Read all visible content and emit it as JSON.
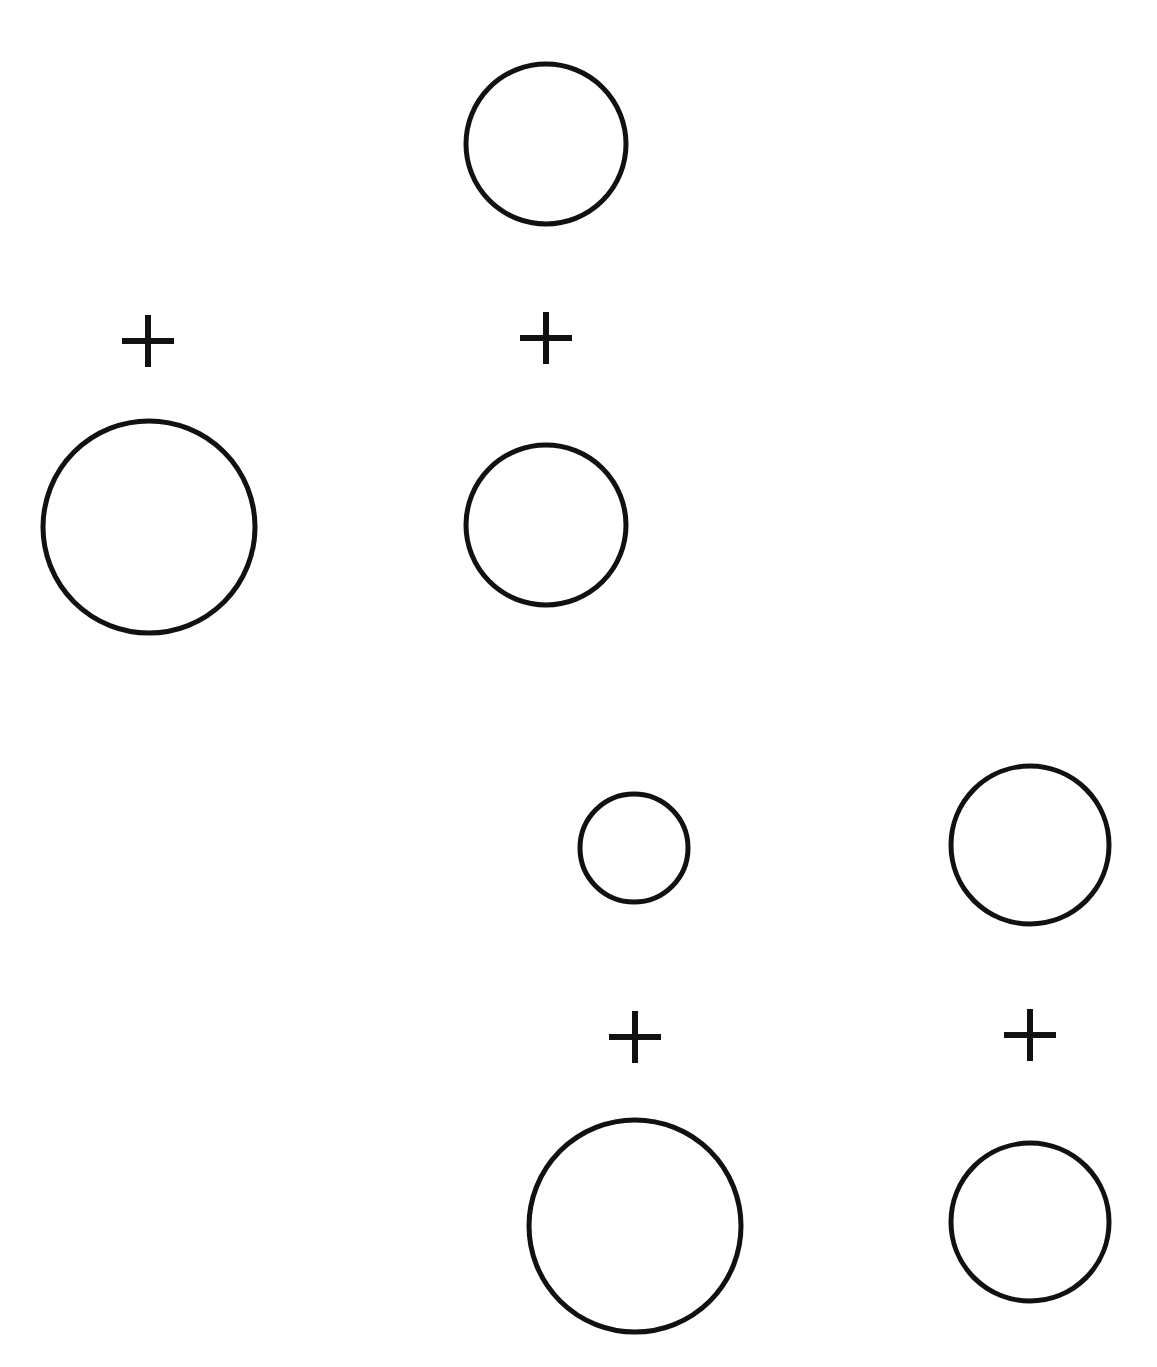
{
  "canvas": {
    "width": 1157,
    "height": 1367,
    "background": "#ffffff",
    "stroke_color": "#111111"
  },
  "circles": [
    {
      "id": "top-circle",
      "cx": 546,
      "cy": 144,
      "r": 80,
      "stroke_width": 5
    },
    {
      "id": "left-large-circle",
      "cx": 149,
      "cy": 527,
      "r": 106,
      "stroke_width": 5
    },
    {
      "id": "middle-circle",
      "cx": 546,
      "cy": 525,
      "r": 80,
      "stroke_width": 5
    },
    {
      "id": "small-circle",
      "cx": 634,
      "cy": 848,
      "r": 54,
      "stroke_width": 5
    },
    {
      "id": "right-upper-circle",
      "cx": 1030,
      "cy": 845,
      "r": 79,
      "stroke_width": 5
    },
    {
      "id": "bottom-large-circle",
      "cx": 635,
      "cy": 1226,
      "r": 106,
      "stroke_width": 5
    },
    {
      "id": "bottom-right-circle",
      "cx": 1030,
      "cy": 1222,
      "r": 79,
      "stroke_width": 5
    }
  ],
  "plus_signs": [
    {
      "id": "plus-left",
      "cx": 148,
      "cy": 341,
      "half": 26,
      "stroke_width": 6
    },
    {
      "id": "plus-middle",
      "cx": 546,
      "cy": 338,
      "half": 26,
      "stroke_width": 6
    },
    {
      "id": "plus-bottom-left",
      "cx": 635,
      "cy": 1037,
      "half": 26,
      "stroke_width": 6
    },
    {
      "id": "plus-bottom-right",
      "cx": 1030,
      "cy": 1035,
      "half": 26,
      "stroke_width": 6
    }
  ]
}
